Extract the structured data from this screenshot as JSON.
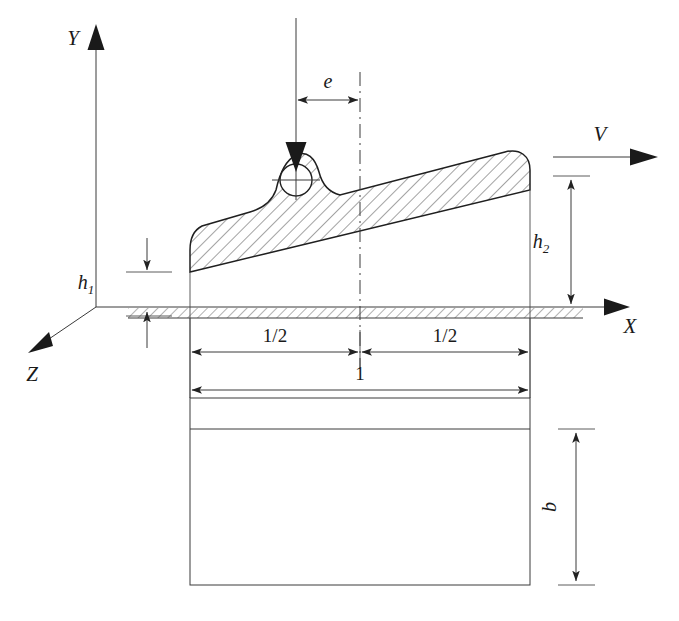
{
  "figure": {
    "type": "engineering-schematic",
    "background_color": "#ffffff",
    "line_color": "#2b2b2b"
  },
  "axes": {
    "y_label": "Y",
    "x_label": "X",
    "z_label": "Z",
    "origin_px": [
      96,
      307
    ]
  },
  "labels": {
    "eccentricity": "e",
    "film_thickness_inlet_base": "h",
    "film_thickness_inlet_sub": "1",
    "film_thickness_outlet_base": "h",
    "film_thickness_outlet_sub": "2",
    "velocity": "V",
    "half_length_left": "1/2",
    "half_length_right": "1/2",
    "full_length": "1",
    "width": "b"
  },
  "dimensions": {
    "left_half": "1/2",
    "right_half": "1/2",
    "total_length": "1",
    "pad_width": "b",
    "offset": "e",
    "inlet_gap": "h1",
    "outlet_gap": "h2"
  },
  "geometry": {
    "pad_left_x": 190,
    "pad_right_x": 530,
    "pad_centerline_x": 360,
    "load_line_x": 296,
    "ground_y": 307,
    "ground_band_bottom_y": 316,
    "plan_rect_top_y": 398,
    "plan_rect_bottom_y": 585,
    "pivot_center": [
      296,
      180
    ],
    "pivot_radius": 16
  },
  "colors": {
    "stroke": "#2b2b2b",
    "hatch": "#555555",
    "arrow": "#1a1a1a"
  }
}
